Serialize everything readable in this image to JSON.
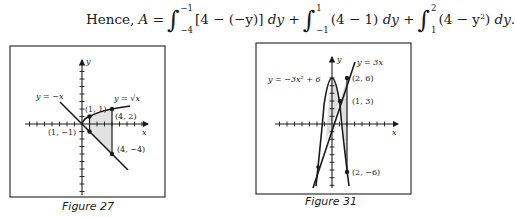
{
  "equation": {
    "prefix": "Hence,",
    "lhs": "A",
    "equals": "=",
    "terms": [
      {
        "upper": "−1",
        "lower": "−4",
        "integrand": "[4 − (−y)]",
        "differential": "dy",
        "joiner": "+"
      },
      {
        "upper": "1",
        "lower": "−1",
        "integrand": "(4 − 1)",
        "differential": "dy",
        "joiner": "+"
      },
      {
        "upper": "2",
        "lower": "1",
        "integrand_pre": "(4 − y",
        "integrand_exp": "2",
        "integrand_post": ")",
        "differential": "dy",
        "joiner": "."
      }
    ]
  },
  "figures": [
    {
      "caption": "Figure 27",
      "axis_labels": {
        "x": "x",
        "y": "y"
      },
      "curves": [
        {
          "label": "y = −x"
        },
        {
          "label": "y = √x"
        }
      ],
      "points": [
        {
          "label": "(1, 1)",
          "x": 1,
          "y": 1
        },
        {
          "label": "(4, 2)",
          "x": 4,
          "y": 2
        },
        {
          "label": "(1, −1)",
          "x": 1,
          "y": -1
        },
        {
          "label": "(4, −4)",
          "x": 4,
          "y": -4
        }
      ]
    },
    {
      "caption": "Figure 31",
      "axis_labels": {
        "x": "x",
        "y": "y"
      },
      "curves": [
        {
          "label": "y = −3x² + 6"
        },
        {
          "label": "y = 3x"
        }
      ],
      "points": [
        {
          "label": "(2, 6)",
          "x": 2,
          "y": 6
        },
        {
          "label": "(1, 3)",
          "x": 1,
          "y": 3
        },
        {
          "label": "(2, −6)",
          "x": 2,
          "y": -6
        }
      ]
    }
  ]
}
